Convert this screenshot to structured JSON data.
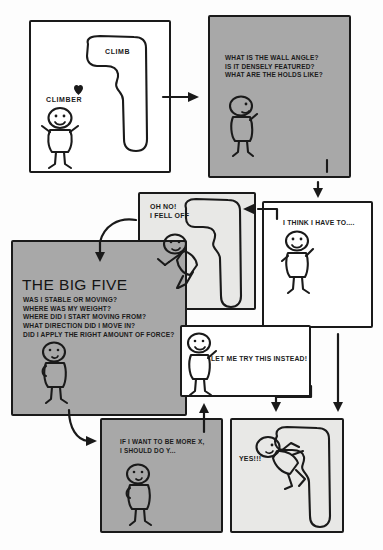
{
  "diagram": {
    "colors": {
      "ink": "#1a1a1a",
      "panel_grey": "#a8a8a8",
      "panel_white": "#ffffff",
      "panel_light": "#e8e8e6",
      "page_background": "#fdfdfd"
    }
  },
  "panels": {
    "climber_wall": {
      "name": "climber-and-climb-panel",
      "fill": "white",
      "labels": {
        "climber": "CLIMBER",
        "climb": "CLIMB",
        "heart": "♥"
      }
    },
    "assess": {
      "name": "assess-the-wall-panel",
      "fill": "grey",
      "lines": [
        "WHAT IS THE WALL ANGLE?",
        "IS IT DENSELY FEATURED?",
        "WHAT ARE THE HOLDS LIKE?"
      ]
    },
    "plan": {
      "name": "plan-attempt-panel",
      "fill": "white",
      "caption": "I THINK I HAVE TO...."
    },
    "fall": {
      "name": "fell-off-panel",
      "fill": "light",
      "caption": "OH NO!\nI FELL OFF"
    },
    "big_five": {
      "name": "the-big-five-panel",
      "fill": "grey",
      "title": "THE BIG FIVE",
      "questions": [
        "WAS I STABLE OR MOVING?",
        "WHERE WAS MY WEIGHT?",
        "WHERE DID I START MOVING FROM?",
        "WHAT DIRECTION DID I MOVE IN?",
        "DID I APPLY THE RIGHT AMOUNT OF FORCE?"
      ]
    },
    "retry": {
      "name": "try-this-instead-panel",
      "fill": "white",
      "caption": "LET ME TRY THIS INSTEAD!"
    },
    "hypothesis": {
      "name": "if-x-then-y-panel",
      "fill": "grey",
      "caption": "IF I WANT TO BE MORE X,\nI SHOULD DO Y..."
    },
    "success": {
      "name": "success-panel",
      "fill": "light",
      "caption": "YES!!!"
    }
  }
}
